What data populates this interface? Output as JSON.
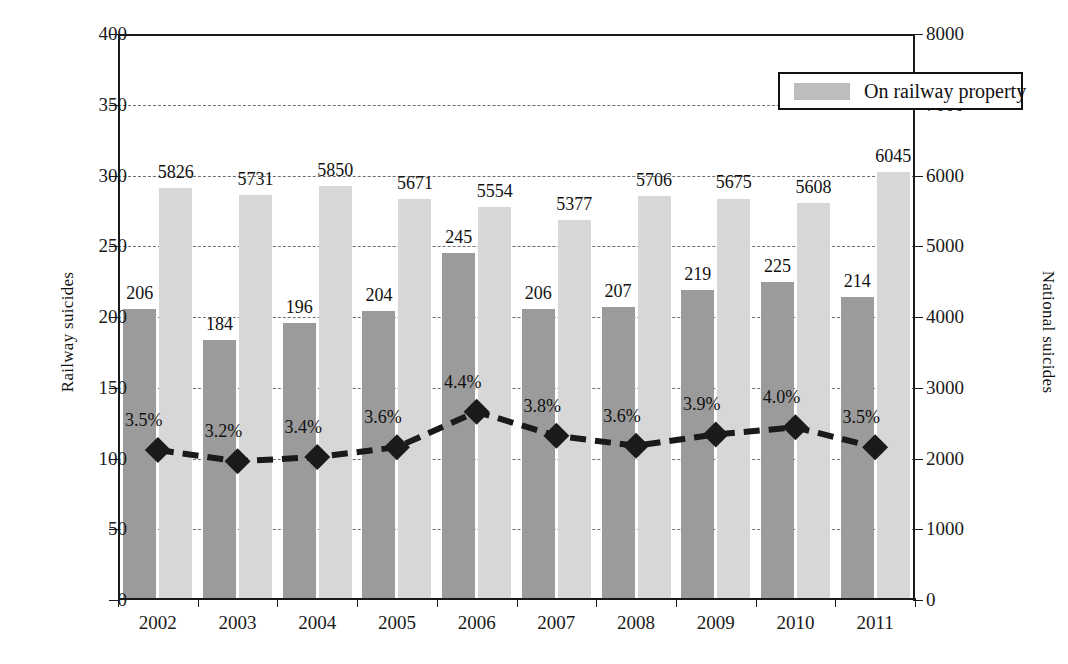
{
  "chart_data": {
    "type": "bar",
    "title": "",
    "xlabel": "",
    "ylabel": "Railway suicides",
    "y2label": "National suicides",
    "categories": [
      "2002",
      "2003",
      "2004",
      "2005",
      "2006",
      "2007",
      "2008",
      "2009",
      "2010",
      "2011"
    ],
    "ylim": [
      0,
      400
    ],
    "y2lim": [
      0,
      8000
    ],
    "yticks": [
      "0",
      "50",
      "100",
      "150",
      "200",
      "250",
      "300",
      "350",
      "400"
    ],
    "y2ticks": [
      "0",
      "1000",
      "2000",
      "3000",
      "4000",
      "5000",
      "6000",
      "7000",
      "8000"
    ],
    "grid": true,
    "legend_position": "top-right",
    "series": [
      {
        "name": "Railway suicides",
        "axis": "left",
        "kind": "bar",
        "color": "#9b9b9b",
        "values": [
          206,
          184,
          196,
          204,
          245,
          206,
          207,
          219,
          225,
          214
        ],
        "labels": [
          "206",
          "184",
          "196",
          "204",
          "245",
          "206",
          "207",
          "219",
          "225",
          "214"
        ]
      },
      {
        "name": "National suicides",
        "axis": "right",
        "kind": "bar",
        "color": "#d7d7d7",
        "values": [
          5826,
          5731,
          5850,
          5671,
          5554,
          5377,
          5706,
          5675,
          5608,
          6045
        ],
        "labels": [
          "5826",
          "5731",
          "5850",
          "5671",
          "5554",
          "5377",
          "5706",
          "5675",
          "5608",
          "6045"
        ]
      },
      {
        "name": "On railway property",
        "axis": "left",
        "kind": "line",
        "color": "#1a1a1a",
        "values": [
          106,
          98,
          101,
          108,
          133,
          116,
          109,
          117,
          122,
          108
        ],
        "labels": [
          "3.5%",
          "3.2%",
          "3.4%",
          "3.6%",
          "4.4%",
          "3.8%",
          "3.6%",
          "3.9%",
          "4.0%",
          "3.5%"
        ]
      }
    ]
  },
  "legend": {
    "entries": [
      {
        "label": "On railway property",
        "swatch_color": "#bdbdbd"
      }
    ]
  },
  "axes": {
    "left_title": "Railway suicides",
    "right_title": "National suicides"
  }
}
